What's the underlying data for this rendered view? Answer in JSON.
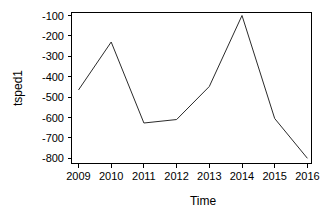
{
  "chart_data": {
    "type": "line",
    "title": "",
    "xlabel": "Time",
    "ylabel": "tsped1",
    "x": [
      2009,
      2010,
      2011,
      2012,
      2013,
      2014,
      2015,
      2016
    ],
    "values": [
      -465,
      -230,
      -627,
      -610,
      -448,
      -100,
      -605,
      -800
    ],
    "series": [
      {
        "name": "tsped1",
        "values": [
          -465,
          -230,
          -627,
          -610,
          -448,
          -100,
          -605,
          -800
        ]
      }
    ],
    "xticks": [
      "2009",
      "2010",
      "2011",
      "2012",
      "2013",
      "2014",
      "2015",
      "2016"
    ],
    "yticks": [
      "-100",
      "-200",
      "-300",
      "-400",
      "-500",
      "-600",
      "-700",
      "-800"
    ],
    "ytick_values": [
      -100,
      -200,
      -300,
      -400,
      -500,
      -600,
      -700,
      -800
    ],
    "xlim": [
      2009,
      2016
    ],
    "ylim": [
      -810,
      -95
    ],
    "grid": false,
    "legend": false,
    "line_color": "#2b2b2b",
    "axis_color": "#000000",
    "background": "#ffffff"
  },
  "axis": {
    "y_label": "tsped1",
    "x_label": "Time",
    "y_ticks": [
      {
        "label": "-100"
      },
      {
        "label": "-200"
      },
      {
        "label": "-300"
      },
      {
        "label": "-400"
      },
      {
        "label": "-500"
      },
      {
        "label": "-600"
      },
      {
        "label": "-700"
      },
      {
        "label": "-800"
      }
    ],
    "x_ticks": [
      {
        "label": "2009"
      },
      {
        "label": "2010"
      },
      {
        "label": "2011"
      },
      {
        "label": "2012"
      },
      {
        "label": "2013"
      },
      {
        "label": "2014"
      },
      {
        "label": "2015"
      },
      {
        "label": "2016"
      }
    ]
  }
}
